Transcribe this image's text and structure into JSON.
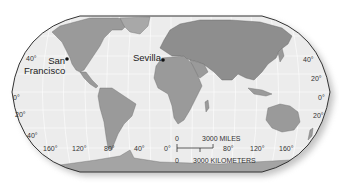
{
  "map": {
    "projection": "robinson",
    "colors": {
      "ocean": "#ececec",
      "land": "#9a9a9a",
      "land_dark": "#7c7c7c",
      "outline": "#333333",
      "graticule": "#ffffff"
    },
    "cities": [
      {
        "name": "San Francisco",
        "line1": "San",
        "line2": "Francisco"
      },
      {
        "name": "Sevilla",
        "line1": "Sevilla"
      }
    ],
    "latitude_labels_left": [
      "40°",
      "0°",
      "20°",
      "40°"
    ],
    "latitude_labels_right": [
      "40°",
      "20°",
      "0°",
      "20°"
    ],
    "longitude_labels": [
      "160°",
      "120°",
      "80°",
      "40°",
      "0°",
      "80°",
      "120°",
      "160°"
    ],
    "scale_bar": {
      "miles_zero": "0",
      "miles_label": "3000 MILES",
      "km_zero": "0",
      "km_label": "3000 KILOMETERS"
    }
  }
}
